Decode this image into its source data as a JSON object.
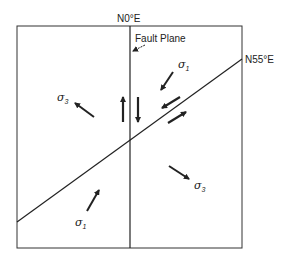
{
  "diagram": {
    "fault_trace_label": "N0°E",
    "fault_plane_label": "Fault Plane",
    "conjugate_trace_label": "N55°E",
    "stress_labels": {
      "sigma1_upper": {
        "symbol": "σ",
        "subscript": "1"
      },
      "sigma3_left": {
        "symbol": "σ",
        "subscript": "3"
      },
      "sigma3_right": {
        "symbol": "σ",
        "subscript": "3"
      },
      "sigma1_lower": {
        "symbol": "σ",
        "subscript": "1"
      }
    },
    "colors": {
      "line": "#222222",
      "box": "#333333",
      "background": "#ffffff"
    }
  }
}
